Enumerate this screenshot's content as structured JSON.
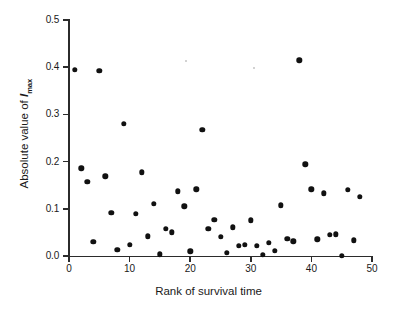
{
  "chart_data": {
    "type": "scatter",
    "title": "",
    "xlabel": "Rank of survival time",
    "ylabel_prefix": "Absolute value of ",
    "ylabel_symbol": "I",
    "ylabel_subscript": "max",
    "xlim": [
      0,
      50
    ],
    "ylim": [
      0.0,
      0.5
    ],
    "grid": false,
    "legend": null,
    "xticks": [
      0,
      10,
      20,
      30,
      40,
      50
    ],
    "xtick_labels": [
      "0",
      "10",
      "20",
      "30",
      "40",
      "50"
    ],
    "yticks": [
      0.0,
      0.1,
      0.2,
      0.3,
      0.4,
      0.5
    ],
    "ytick_labels": [
      "0.0",
      "0.1",
      "0.2",
      "0.3",
      "0.4",
      "0.5"
    ],
    "marker": "filled-circle",
    "marker_color": "#111111",
    "n_points": 48,
    "x": [
      1,
      2,
      3,
      4,
      5,
      6,
      7,
      8,
      9,
      10,
      11,
      12,
      13,
      14,
      15,
      16,
      17,
      18,
      19,
      20,
      21,
      22,
      23,
      24,
      25,
      26,
      27,
      28,
      29,
      30,
      31,
      32,
      33,
      34,
      35,
      36,
      37,
      38,
      39,
      40,
      41,
      42,
      43,
      44,
      45,
      46,
      47,
      48
    ],
    "y": [
      0.395,
      0.186,
      0.157,
      0.03,
      0.393,
      0.169,
      0.091,
      0.013,
      0.28,
      0.024,
      0.09,
      0.177,
      0.042,
      0.111,
      0.004,
      0.057,
      0.05,
      0.137,
      0.105,
      0.01,
      0.141,
      0.268,
      0.057,
      0.077,
      0.041,
      0.007,
      0.061,
      0.022,
      0.024,
      0.076,
      0.022,
      0.002,
      0.028,
      0.011,
      0.107,
      0.037,
      0.031,
      0.415,
      0.194,
      0.141,
      0.035,
      0.133,
      0.045,
      0.046,
      0.0,
      0.14,
      0.033,
      0.125
    ]
  },
  "axes": {
    "x_title": "Rank of survival time",
    "y_title_prefix": "Absolute value of ",
    "y_title_symbol": "I",
    "y_title_sub": "max"
  }
}
